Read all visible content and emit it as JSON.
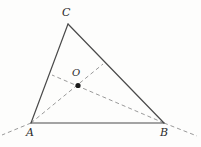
{
  "figure": {
    "type": "geometry-diagram",
    "background_color": "#fdfdfc",
    "solid_stroke_color": "#4a4a4a",
    "dashed_stroke_color": "#9a9a9a",
    "point_fill_color": "#1a1a1a",
    "label_color": "#2b2b2b",
    "labels": {
      "vertex_a": "A",
      "vertex_b": "B",
      "vertex_c": "C",
      "point_o": "O"
    },
    "points": {
      "A": {
        "x": 31,
        "y": 123
      },
      "B": {
        "x": 164,
        "y": 123
      },
      "C": {
        "x": 68,
        "y": 24
      },
      "O": {
        "x": 78,
        "y": 85.5
      }
    },
    "solid_edges": [
      {
        "name": "edge-AC",
        "x1": 31,
        "y1": 123,
        "x2": 68,
        "y2": 24
      },
      {
        "name": "edge-CB",
        "x1": 68,
        "y1": 24,
        "x2": 164,
        "y2": 123
      },
      {
        "name": "edge-AB",
        "x1": 31,
        "y1": 123,
        "x2": 164,
        "y2": 123
      }
    ],
    "dashed_lines": [
      {
        "name": "ray-A-through-O",
        "x1": 31,
        "y1": 123,
        "x2": 103,
        "y2": 64
      },
      {
        "name": "ray-B-through-O",
        "x1": 164,
        "y1": 123,
        "x2": 52,
        "y2": 75
      },
      {
        "name": "extension-beyond-A",
        "x1": 31,
        "y1": 123,
        "x2": 2,
        "y2": 135
      },
      {
        "name": "extension-beyond-B",
        "x1": 164,
        "y1": 123,
        "x2": 197,
        "y2": 136
      }
    ],
    "point_radius": 2.6,
    "solid_width": 1.2,
    "dashed_width": 1.0,
    "dash_pattern": "4,3"
  }
}
